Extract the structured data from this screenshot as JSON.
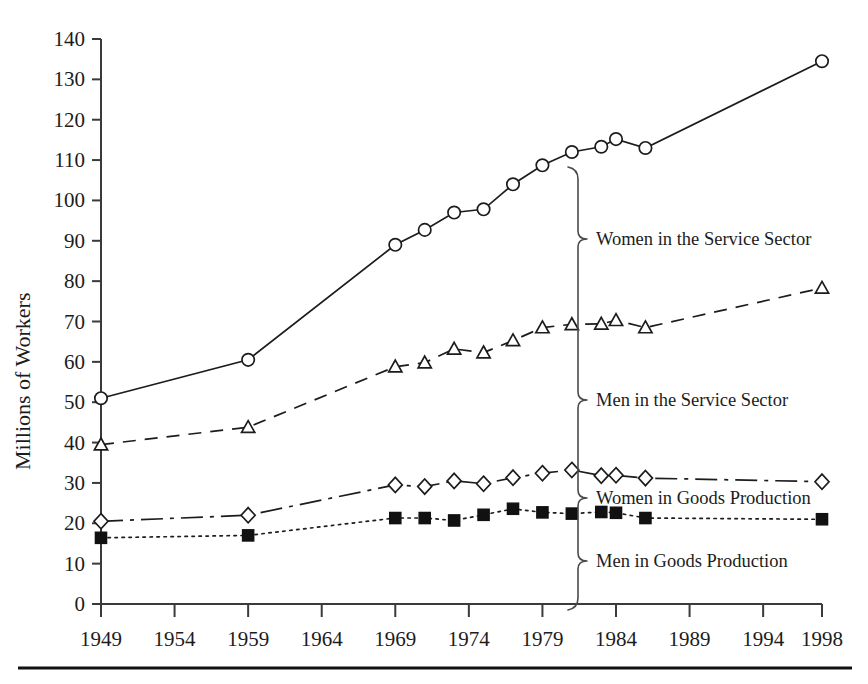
{
  "figure": {
    "width": 868,
    "height": 684,
    "background": "#ffffff",
    "ink_color": "#1c1c1c"
  },
  "axis": {
    "y_title": "Millions of Workers",
    "y_ticks": [
      "0",
      "10",
      "20",
      "30",
      "40",
      "50",
      "60",
      "70",
      "80",
      "90",
      "100",
      "110",
      "120",
      "130",
      "140"
    ],
    "x_ticks": [
      "1949",
      "1954",
      "1959",
      "1964",
      "1969",
      "1974",
      "1979",
      "1984",
      "1989",
      "1994",
      "1998"
    ]
  },
  "annotations": {
    "women_service": "Women in the Service Sector",
    "men_service": "Men in the Service Sector",
    "women_goods": "Women in Goods Production",
    "men_goods": "Men in Goods Production"
  },
  "chart_data": {
    "type": "line",
    "title": "",
    "xlabel": "",
    "ylabel": "Millions of Workers",
    "xlim": [
      1949,
      1998
    ],
    "ylim": [
      0,
      140
    ],
    "ytick_step": 10,
    "xtick_values": [
      1949,
      1954,
      1959,
      1964,
      1969,
      1974,
      1979,
      1984,
      1989,
      1994,
      1998
    ],
    "grid": false,
    "legend": "inline-braced-labels-right",
    "series": [
      {
        "name": "Women in the Service Sector",
        "marker": "circle-open",
        "line_style": "solid",
        "points": [
          {
            "x": 1949,
            "y": 51
          },
          {
            "x": 1959,
            "y": 60.5
          },
          {
            "x": 1969,
            "y": 89
          },
          {
            "x": 1971,
            "y": 92.7
          },
          {
            "x": 1973,
            "y": 97
          },
          {
            "x": 1975,
            "y": 97.8
          },
          {
            "x": 1977,
            "y": 104
          },
          {
            "x": 1979,
            "y": 108.7
          },
          {
            "x": 1981,
            "y": 112
          },
          {
            "x": 1983,
            "y": 113.3
          },
          {
            "x": 1984,
            "y": 115.2
          },
          {
            "x": 1986,
            "y": 113
          },
          {
            "x": 1998,
            "y": 134.5
          }
        ]
      },
      {
        "name": "Men in the Service Sector",
        "marker": "triangle-open",
        "line_style": "dashed",
        "points": [
          {
            "x": 1949,
            "y": 39.5
          },
          {
            "x": 1959,
            "y": 43.8
          },
          {
            "x": 1969,
            "y": 58.8
          },
          {
            "x": 1971,
            "y": 59.8
          },
          {
            "x": 1973,
            "y": 63.2
          },
          {
            "x": 1975,
            "y": 62.3
          },
          {
            "x": 1977,
            "y": 65.3
          },
          {
            "x": 1979,
            "y": 68.5
          },
          {
            "x": 1981,
            "y": 69.3
          },
          {
            "x": 1983,
            "y": 69.4
          },
          {
            "x": 1984,
            "y": 70.3
          },
          {
            "x": 1986,
            "y": 68.5
          },
          {
            "x": 1998,
            "y": 78.3
          }
        ]
      },
      {
        "name": "Women in Goods Production",
        "marker": "diamond-open",
        "line_style": "dash-dot",
        "points": [
          {
            "x": 1949,
            "y": 20.5
          },
          {
            "x": 1959,
            "y": 22
          },
          {
            "x": 1969,
            "y": 29.5
          },
          {
            "x": 1971,
            "y": 29.1
          },
          {
            "x": 1973,
            "y": 30.5
          },
          {
            "x": 1975,
            "y": 29.8
          },
          {
            "x": 1977,
            "y": 31.3
          },
          {
            "x": 1979,
            "y": 32.4
          },
          {
            "x": 1981,
            "y": 33.2
          },
          {
            "x": 1983,
            "y": 31.8
          },
          {
            "x": 1984,
            "y": 31.9
          },
          {
            "x": 1986,
            "y": 31.2
          },
          {
            "x": 1998,
            "y": 30.3
          }
        ]
      },
      {
        "name": "Men in Goods Production",
        "marker": "square-filled",
        "line_style": "dotted",
        "points": [
          {
            "x": 1949,
            "y": 16.4
          },
          {
            "x": 1959,
            "y": 17
          },
          {
            "x": 1969,
            "y": 21.3
          },
          {
            "x": 1971,
            "y": 21.3
          },
          {
            "x": 1973,
            "y": 20.7
          },
          {
            "x": 1975,
            "y": 22.1
          },
          {
            "x": 1977,
            "y": 23.6
          },
          {
            "x": 1979,
            "y": 22.7
          },
          {
            "x": 1981,
            "y": 22.4
          },
          {
            "x": 1983,
            "y": 22.8
          },
          {
            "x": 1984,
            "y": 22.6
          },
          {
            "x": 1986,
            "y": 21.3
          },
          {
            "x": 1998,
            "y": 21
          }
        ]
      }
    ]
  }
}
